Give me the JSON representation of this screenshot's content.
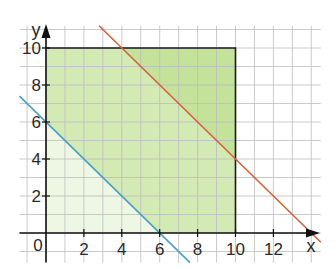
{
  "chart_data": {
    "type": "line",
    "title": "",
    "xlabel": "x",
    "ylabel": "y",
    "origin_label": "0",
    "xlim": [
      -1.4,
      14.5
    ],
    "ylim": [
      -1.6,
      11.2
    ],
    "grid": true,
    "grid_step": 1,
    "x_ticks": [
      "2",
      "4",
      "6",
      "8",
      "10",
      "12"
    ],
    "x_tick_values": [
      2,
      4,
      6,
      8,
      10,
      12
    ],
    "y_ticks": [
      "2",
      "4",
      "6",
      "8",
      "10"
    ],
    "y_tick_values": [
      2,
      4,
      6,
      8,
      10
    ],
    "series": [
      {
        "name": "red-line",
        "equation": "x + y = 14",
        "color": "#d4603c",
        "points": [
          [
            2.8,
            11.2
          ],
          [
            14.5,
            -0.5
          ]
        ]
      },
      {
        "name": "blue-line",
        "equation": "x + y = 6",
        "color": "#4a9fc4",
        "points": [
          [
            -1.4,
            7.4
          ],
          [
            7.6,
            -1.6
          ]
        ]
      }
    ],
    "regions": [
      {
        "name": "region-below-blue-line",
        "color": "#eef7e3",
        "vertices": [
          [
            0,
            0
          ],
          [
            6,
            0
          ],
          [
            0,
            6
          ]
        ]
      },
      {
        "name": "region-between-lines",
        "color": "#d3eab5",
        "vertices": [
          [
            6,
            0
          ],
          [
            10,
            0
          ],
          [
            10,
            4
          ],
          [
            4,
            10
          ],
          [
            0,
            10
          ],
          [
            0,
            6
          ]
        ]
      },
      {
        "name": "region-above-red-line",
        "color": "#c5e29a",
        "vertices": [
          [
            4,
            10
          ],
          [
            10,
            10
          ],
          [
            10,
            4
          ]
        ]
      }
    ],
    "rectangle": {
      "x_range": [
        0,
        10
      ],
      "y_range": [
        0,
        10
      ],
      "border_color": "#1a1a1a"
    },
    "colors": {
      "grid": "#bdbdbd",
      "axis": "#111111"
    }
  }
}
